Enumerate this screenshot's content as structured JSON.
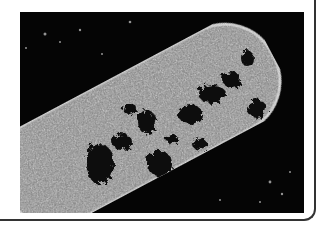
{
  "image": {
    "subject": "electron micrograph of a rod-shaped bacterium",
    "alt": "Transmission electron micrograph of a rod-shaped bacterial cell with dark nucleoid regions on a black background",
    "colors": {
      "background": "#050505",
      "cell_body": "#8a8a8a",
      "cell_wall": "#bdbdbd",
      "nucleoid": "#0a0a0a",
      "frame_border": "#333333",
      "page": "#ffffff"
    }
  }
}
